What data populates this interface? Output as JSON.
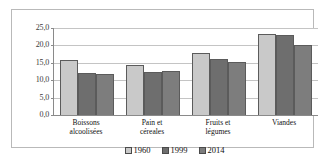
{
  "chart_data": {
    "type": "bar",
    "title": "",
    "xlabel": "",
    "ylabel": "",
    "ylim": [
      0,
      25
    ],
    "grid": true,
    "legend_position": "bottom",
    "categories": [
      "Boissons alcoolisées",
      "Pain et céreales",
      "Fruits et légumes",
      "Viandes"
    ],
    "category_lines": [
      [
        "Boissons",
        "alcoolisées"
      ],
      [
        "Pain et",
        "céreales"
      ],
      [
        "Fruits et",
        "légumes"
      ],
      [
        "Viandes"
      ]
    ],
    "ytick_labels": [
      "25,0",
      "20,0",
      "15,0",
      "10,0",
      "5,0",
      "0,0"
    ],
    "ytick_values": [
      25.0,
      20.0,
      15.0,
      10.0,
      5.0,
      0.0
    ],
    "series": [
      {
        "name": "1960",
        "color": "#c9c9c9",
        "values": [
          15.7,
          14.3,
          17.7,
          23.2
        ]
      },
      {
        "name": "1999",
        "color": "#6e6e6e",
        "values": [
          12.1,
          12.3,
          16.0,
          23.1
        ]
      },
      {
        "name": "2014",
        "color": "#7d7d7d",
        "values": [
          11.8,
          12.7,
          15.2,
          20.0
        ]
      }
    ]
  },
  "legend": {
    "items": [
      {
        "label": "1960",
        "swatch": "legend-swatch-1960"
      },
      {
        "label": "1999",
        "swatch": "legend-swatch-1999"
      },
      {
        "label": "2014",
        "swatch": "legend-swatch-2014"
      }
    ]
  }
}
